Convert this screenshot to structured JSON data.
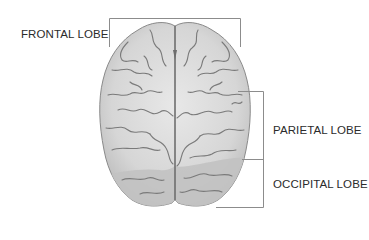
{
  "figure": {
    "labels": {
      "frontal": "FRONTAL LOBE",
      "parietal": "PARIETAL LOBE",
      "occipital": "OCCIPITAL LOBE"
    },
    "colors": {
      "brain_fill": "#d4d4d4",
      "brain_highlight": "#e6e6e6",
      "occipital_fill": "#c4c4c4",
      "sulci": "#7a7a7a",
      "outline": "#8a8a8a",
      "bracket": "#8c8c8c",
      "label_text": "#2b2b2b"
    }
  }
}
